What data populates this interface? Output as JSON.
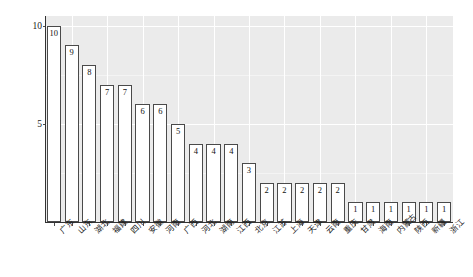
{
  "chart_data": {
    "type": "bar",
    "title": "",
    "subtitle": "",
    "xlabel": "",
    "ylabel": "核心场数量（个）",
    "ylim": [
      0,
      10.5
    ],
    "yticks": [
      5,
      10
    ],
    "ytick_labels": [
      "5",
      "10"
    ],
    "grid": true,
    "legend": null,
    "orientation": "vertical",
    "bar_fill": "#ffffff",
    "bar_edge": "#4a4a4a",
    "panel_background": "#ebebeb",
    "gridline_color": "#ffffff",
    "categories": [
      "广东",
      "山东",
      "湖北",
      "福建",
      "四川",
      "安徽",
      "河南",
      "广西",
      "河北",
      "湖南",
      "江西",
      "北京",
      "江苏",
      "上海",
      "天津",
      "云南",
      "重庆",
      "甘肃",
      "海南",
      "内蒙古",
      "陕西",
      "新疆",
      "浙江"
    ],
    "values": [
      10,
      9,
      8,
      7,
      7,
      6,
      6,
      5,
      4,
      4,
      4,
      3,
      2,
      2,
      2,
      2,
      2,
      1,
      1,
      1,
      1,
      1,
      1
    ],
    "data_labels": [
      "10",
      "9",
      "8",
      "7",
      "7",
      "6",
      "6",
      "5",
      "4",
      "4",
      "4",
      "3",
      "2",
      "2",
      "2",
      "2",
      "2",
      "1",
      "1",
      "1",
      "1",
      "1",
      "1"
    ]
  }
}
